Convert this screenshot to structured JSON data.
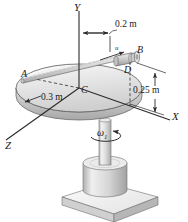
{
  "figure": {
    "background_color": "#ffffff",
    "line_color": "#3a3a3a",
    "shade_light": "#f0f0f0",
    "shade_mid": "#d8d8d8",
    "shade_dark": "#b5b5b5",
    "axes": [
      {
        "name": "y-axis",
        "label": "Y"
      },
      {
        "name": "x-axis",
        "label": "X"
      },
      {
        "name": "z-axis",
        "label": "Z"
      }
    ],
    "points": [
      {
        "name": "point-a",
        "label": "A"
      },
      {
        "name": "point-b",
        "label": "B"
      },
      {
        "name": "point-c",
        "label": "C"
      },
      {
        "name": "point-d",
        "label": "D"
      }
    ],
    "dimensions": [
      {
        "name": "horizontal-offset",
        "label": "0.2 m"
      },
      {
        "name": "disk-radius",
        "label": "0.3 m"
      },
      {
        "name": "vertical-height",
        "label": "0.25 m"
      }
    ],
    "velocity": {
      "name": "collar-velocity",
      "label": "u"
    },
    "angular_velocity": {
      "name": "spin-rate",
      "symbol": "ω",
      "subscript": "1"
    }
  }
}
